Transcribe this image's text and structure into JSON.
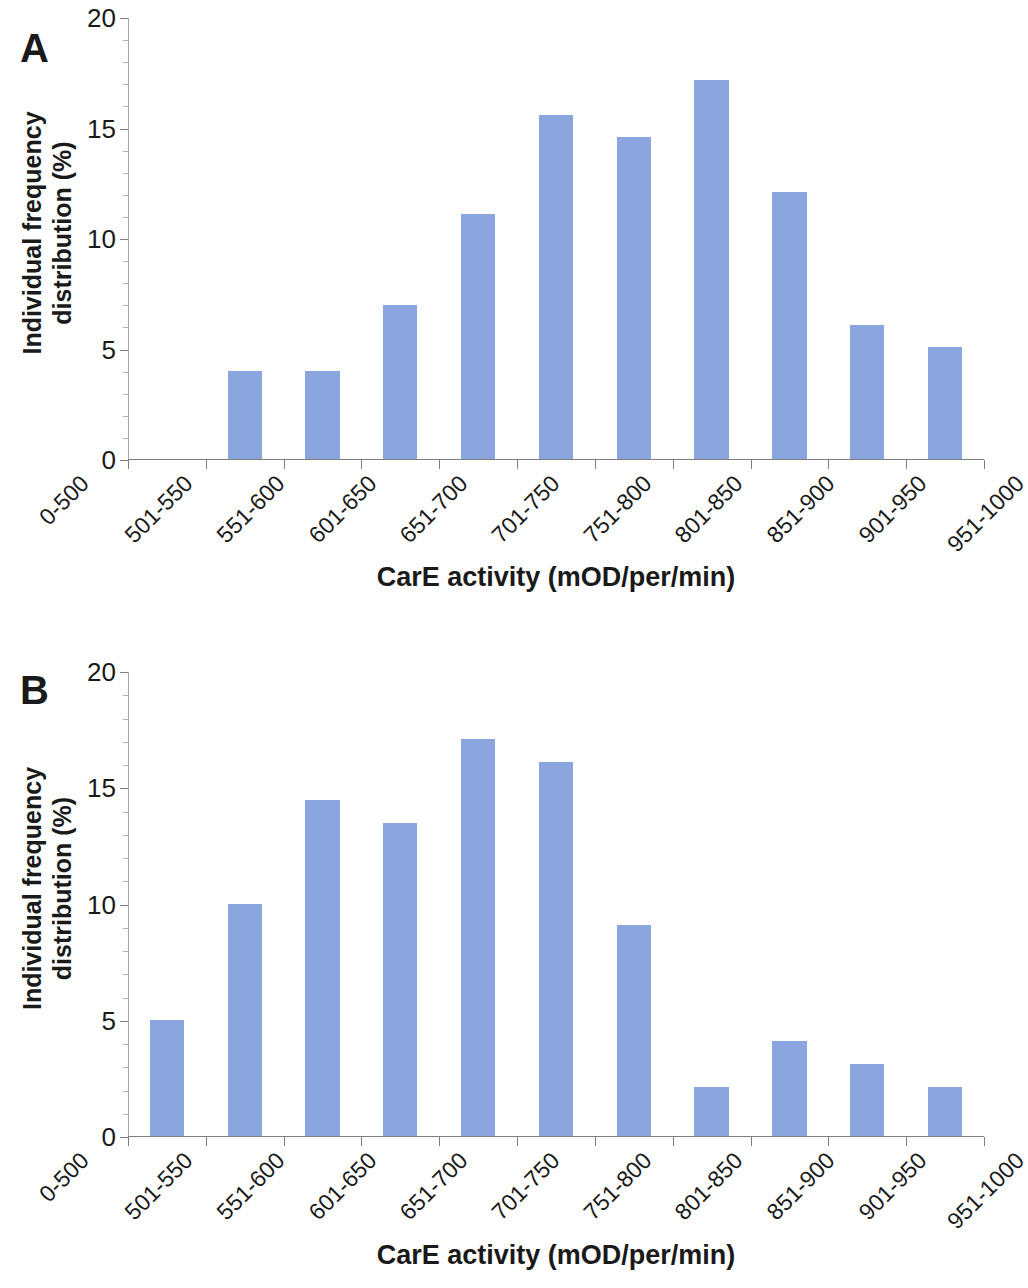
{
  "figure": {
    "panels": [
      {
        "letter": "A",
        "ylabel_line1": "Individual frequency",
        "ylabel_line2": "distribution (%)",
        "xtitle": "CarE activity (mOD/per/min)",
        "ytick_labels": [
          "20",
          "15",
          "10",
          "5",
          "0"
        ]
      },
      {
        "letter": "B",
        "ylabel_line1": "Individual frequency",
        "ylabel_line2": "distribution (%)",
        "xtitle": "CarE activity (mOD/per/min)",
        "ytick_labels": [
          "20",
          "15",
          "10",
          "5",
          "0"
        ]
      }
    ],
    "bar_color": "#8ba6df",
    "axis_color": "#7f7f7f"
  },
  "chart_data": [
    {
      "type": "bar",
      "panel": "A",
      "title": "",
      "xlabel": "CarE activity (mOD/per/min)",
      "ylabel": "Individual frequency distribution (%)",
      "categories": [
        "0-500",
        "501-550",
        "551-600",
        "601-650",
        "651-700",
        "701-750",
        "751-800",
        "801-850",
        "851-900",
        "901-950",
        "951-1000"
      ],
      "values": [
        0,
        4.0,
        4.0,
        7.0,
        11.1,
        15.6,
        14.6,
        17.2,
        12.1,
        6.1,
        5.1
      ],
      "ylim": [
        0,
        20
      ],
      "yticks": [
        0,
        5,
        10,
        15,
        20
      ],
      "grid": false,
      "legend": "none"
    },
    {
      "type": "bar",
      "panel": "B",
      "title": "",
      "xlabel": "CarE activity (mOD/per/min)",
      "ylabel": "Individual frequency distribution (%)",
      "categories": [
        "0-500",
        "501-550",
        "551-600",
        "601-650",
        "651-700",
        "701-750",
        "751-800",
        "801-850",
        "851-900",
        "901-950",
        "951-1000"
      ],
      "values": [
        5.0,
        10.0,
        14.5,
        13.5,
        17.1,
        16.1,
        9.1,
        2.1,
        4.1,
        3.1,
        2.1
      ],
      "ylim": [
        0,
        20
      ],
      "yticks": [
        0,
        5,
        10,
        15,
        20
      ],
      "grid": false,
      "legend": "none"
    }
  ]
}
